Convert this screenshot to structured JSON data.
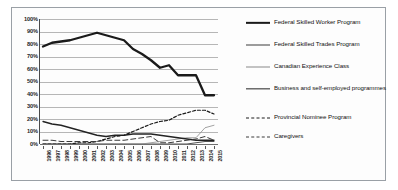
{
  "chart_data": {
    "type": "line",
    "title": "",
    "xlabel": "",
    "ylabel": "",
    "ylim": [
      0,
      100
    ],
    "ytick_labels": [
      "0%",
      "10%",
      "20%",
      "30%",
      "40%",
      "50%",
      "60%",
      "70%",
      "80%",
      "90%",
      "100%"
    ],
    "ytick_values": [
      0,
      10,
      20,
      30,
      40,
      50,
      60,
      70,
      80,
      90,
      100
    ],
    "grid": true,
    "legend_position": "right",
    "x": [
      "1996",
      "1997",
      "1998",
      "1999",
      "2000",
      "2001",
      "2002",
      "2003",
      "2004",
      "2005",
      "2006",
      "2007",
      "2008",
      "2009",
      "2010",
      "2011",
      "2012",
      "2013",
      "2014",
      "2015"
    ],
    "series": [
      {
        "name": "Federal Skilled Worker Program",
        "style": "solid-thick",
        "color": "#1a1a1a",
        "values": [
          78,
          81,
          82,
          83,
          85,
          87,
          89,
          87,
          85,
          83,
          76,
          72,
          67,
          61,
          63,
          55,
          55,
          55,
          39,
          39
        ]
      },
      {
        "name": "Federal Skilled Trades Program",
        "style": "solid-thin",
        "color": "#3c3c3c",
        "values": [
          0,
          0,
          0,
          0,
          0,
          0,
          0,
          0,
          0,
          0,
          0,
          0,
          0,
          0,
          0,
          0,
          0,
          1,
          2,
          2
        ]
      },
      {
        "name": "Canadian Experience Class",
        "style": "solid-light",
        "color": "#8a8a8a",
        "values": [
          0,
          0,
          0,
          0,
          0,
          0,
          0,
          0,
          0,
          0,
          0,
          0,
          1,
          2,
          3,
          4,
          5,
          5,
          13,
          15
        ]
      },
      {
        "name": "Business and self-employed programmes",
        "style": "solid-medium",
        "color": "#222222",
        "values": [
          18,
          16,
          15,
          13,
          11,
          9,
          7,
          6,
          7,
          7,
          8,
          8,
          8,
          7,
          6,
          5,
          4,
          3,
          3,
          3
        ]
      },
      {
        "name": "Provincial Nominee Program",
        "style": "dashed",
        "color": "#1a1a1a",
        "values": [
          0,
          0,
          0,
          0,
          1,
          1,
          2,
          4,
          6,
          7,
          10,
          13,
          16,
          18,
          19,
          23,
          25,
          27,
          27,
          24
        ]
      },
      {
        "name": "Caregivers",
        "style": "long-dash",
        "color": "#3a3a3a",
        "values": [
          3,
          3,
          2,
          2,
          2,
          2,
          2,
          3,
          3,
          3,
          4,
          5,
          6,
          1,
          1,
          2,
          3,
          4,
          6,
          3
        ]
      }
    ]
  },
  "legend": {
    "items": [
      {
        "label": "Federal Skilled Worker Program",
        "swatch": "solid-thick"
      },
      {
        "label": "Federal Skilled Trades Program",
        "swatch": "solid-thin"
      },
      {
        "label": "Canadian Experience Class",
        "swatch": "solid-light"
      },
      {
        "label": "Business and self-employed programmes",
        "swatch": "solid-medium"
      },
      {
        "label": "Provincial Nominee Program",
        "swatch": "dashed"
      },
      {
        "label": "Caregivers",
        "swatch": "long-dash"
      }
    ]
  }
}
